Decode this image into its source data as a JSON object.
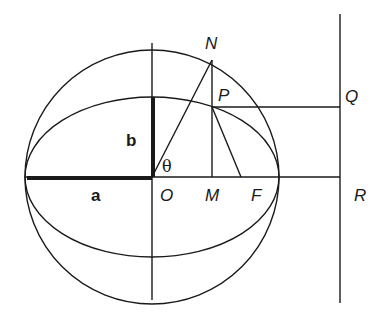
{
  "diagram": {
    "colors": {
      "stroke": "#1a1a1a",
      "background": "#ffffff"
    },
    "labels": {
      "N": "N",
      "P": "P",
      "Q": "Q",
      "R": "R",
      "O": "O",
      "M": "M",
      "F": "F",
      "a": "a",
      "b": "b",
      "theta": "θ"
    },
    "elements": [
      "auxiliary circle of radius a centred at O",
      "ellipse with semi-major axis a and semi-minor axis b",
      "bold semi-major axis segment labelled a",
      "bold semi-minor axis segment labelled b",
      "line ON making angle θ with major axis",
      "vertical line N-P-M",
      "line PF to focus F",
      "horizontal line PQ to directrix",
      "directrix vertical line through Q and R",
      "major axis extended to R"
    ]
  }
}
